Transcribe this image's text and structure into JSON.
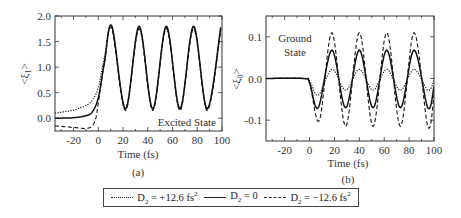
{
  "chart_data": [
    {
      "type": "line",
      "panel": "(a)",
      "annotation": "Excited State",
      "xlabel": "Time (fs)",
      "ylabel": "<ξ1>",
      "xlim": [
        -35,
        100
      ],
      "ylim": [
        -0.25,
        2.0
      ],
      "xticks": [
        -20,
        0,
        20,
        40,
        60,
        80,
        100
      ],
      "yticks": [
        0.0,
        0.5,
        1.0,
        1.5,
        2.0
      ],
      "ytick_labels": [
        "0.0",
        "0.5",
        "1.0",
        "1.5",
        "2.0"
      ],
      "grid": false,
      "series": [
        {
          "name": "D2 = +12.6 fs^2",
          "style": "dotted",
          "x": [
            -35,
            -20,
            -10,
            -5,
            0,
            5,
            11,
            22,
            33,
            44,
            55,
            66,
            77,
            88,
            99
          ],
          "y": [
            0.1,
            0.16,
            0.25,
            0.35,
            0.6,
            1.2,
            1.78,
            0.2,
            1.78,
            0.2,
            1.78,
            0.2,
            1.78,
            0.2,
            1.75
          ]
        },
        {
          "name": "D2 = 0",
          "style": "solid",
          "x": [
            -35,
            -20,
            -10,
            -5,
            0,
            5,
            11,
            22,
            33,
            44,
            55,
            66,
            77,
            88,
            99
          ],
          "y": [
            0.0,
            0.01,
            0.05,
            0.12,
            0.4,
            1.1,
            1.8,
            0.18,
            1.8,
            0.18,
            1.8,
            0.18,
            1.8,
            0.18,
            1.78
          ]
        },
        {
          "name": "D2 = -12.6 fs^2",
          "style": "dashed",
          "x": [
            -35,
            -20,
            -10,
            -5,
            -2,
            0,
            5,
            11,
            22,
            33,
            44,
            55,
            66,
            77,
            88,
            99
          ],
          "y": [
            -0.15,
            -0.18,
            -0.2,
            -0.15,
            0.0,
            0.3,
            1.1,
            1.75,
            0.15,
            1.75,
            0.15,
            1.75,
            0.15,
            1.75,
            0.15,
            1.72
          ]
        }
      ]
    },
    {
      "type": "line",
      "panel": "(b)",
      "annotation": "Ground State",
      "xlabel": "Time (fs)",
      "ylabel": "<ξ0>",
      "xlim": [
        -35,
        100
      ],
      "ylim": [
        -0.15,
        0.15
      ],
      "xticks": [
        -20,
        0,
        20,
        40,
        60,
        80,
        100
      ],
      "yticks": [
        -0.1,
        0.0,
        0.1
      ],
      "ytick_labels": [
        "-0.1",
        "0.0",
        "0.1"
      ],
      "grid": false,
      "series": [
        {
          "name": "D2 = +12.6 fs^2",
          "style": "dotted",
          "x": [
            -35,
            -5,
            0,
            7,
            18,
            29,
            40,
            51,
            62,
            73,
            84,
            95,
            100
          ],
          "y": [
            0,
            0,
            -0.005,
            -0.04,
            0.022,
            -0.028,
            0.022,
            -0.028,
            0.022,
            -0.028,
            0.022,
            -0.028,
            -0.005
          ]
        },
        {
          "name": "D2 = 0",
          "style": "solid",
          "x": [
            -35,
            -5,
            0,
            7,
            18,
            29,
            40,
            51,
            62,
            73,
            84,
            95,
            100
          ],
          "y": [
            0,
            0,
            -0.01,
            -0.07,
            0.068,
            -0.07,
            0.068,
            -0.07,
            0.068,
            -0.07,
            0.068,
            -0.07,
            -0.02
          ]
        },
        {
          "name": "D2 = -12.6 fs^2",
          "style": "dashed",
          "x": [
            -35,
            -5,
            0,
            8,
            18,
            29,
            40,
            51,
            62,
            73,
            84,
            95,
            100
          ],
          "y": [
            0,
            0,
            -0.01,
            -0.1,
            0.11,
            -0.115,
            0.11,
            -0.115,
            0.11,
            -0.115,
            0.11,
            -0.115,
            -0.04
          ]
        }
      ]
    }
  ],
  "panels": {
    "a": {
      "label": "(a)",
      "annotation": "Excited State",
      "xlabel": "Time (fs)",
      "ylabel_main": "<ξ",
      "ylabel_sub": "1",
      "ylabel_end": ">",
      "xtick_labels": [
        "-20",
        "0",
        "20",
        "40",
        "60",
        "80",
        "100"
      ],
      "ytick_labels": [
        "0.0",
        "0.5",
        "1.0",
        "1.5",
        "2.0"
      ]
    },
    "b": {
      "label": "(b)",
      "annotation_line1": "Ground",
      "annotation_line2": "State",
      "xlabel": "Time (fs)",
      "ylabel_main": "<ξ",
      "ylabel_sub": "0",
      "ylabel_end": ">",
      "xtick_labels": [
        "-20",
        "0",
        "20",
        "40",
        "60",
        "80",
        "100"
      ],
      "ytick_labels": [
        "0.1",
        "0.0",
        "-0.1"
      ]
    }
  },
  "legend": {
    "items": [
      {
        "prefix": "D",
        "sub": "2",
        "text": " = +12.6 fs",
        "sup": "2",
        "style": "dotted"
      },
      {
        "prefix": "D",
        "sub": "2",
        "text": " = 0",
        "sup": "",
        "style": "solid"
      },
      {
        "prefix": "D",
        "sub": "2",
        "text": " = −12.6 fs",
        "sup": "2",
        "style": "dashed"
      }
    ]
  }
}
